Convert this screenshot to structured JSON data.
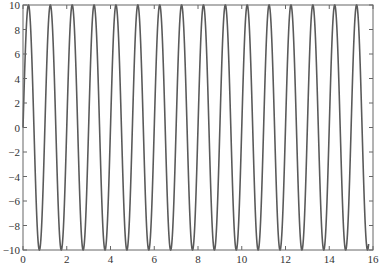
{
  "chart_data": {
    "type": "line",
    "title": "",
    "xlabel": "",
    "ylabel": "",
    "xlim": [
      0,
      16
    ],
    "ylim": [
      -10,
      10
    ],
    "grid": false,
    "legend": null,
    "x_ticks": [
      0,
      2,
      4,
      6,
      8,
      10,
      12,
      14,
      16
    ],
    "y_ticks": [
      -10,
      -8,
      -6,
      -4,
      -2,
      0,
      2,
      4,
      6,
      8,
      10
    ],
    "x_tick_labels": [
      "0",
      "2",
      "4",
      "6",
      "8",
      "10",
      "12",
      "14",
      "16"
    ],
    "y_tick_labels": [
      "−10",
      "−8",
      "−6",
      "−4",
      "−2",
      "0",
      "2",
      "4",
      "6",
      "8",
      "10"
    ],
    "series": [
      {
        "name": "y = 10 sin(2πx)",
        "function": "10*sin(2*pi*x)",
        "amplitude": 10,
        "frequency": 1,
        "x_start": 0,
        "x_end": 15.8,
        "color": "#5a5a5a"
      }
    ]
  },
  "style": {
    "line_color": "#5a5a5a",
    "frame_color": "#666666",
    "text_color": "#333333"
  }
}
